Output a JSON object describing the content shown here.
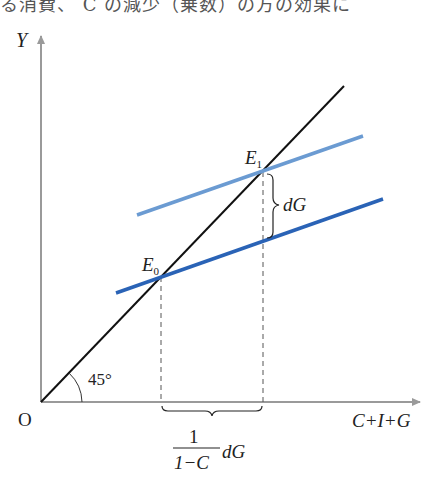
{
  "header": {
    "cut_off_text": "る消費、 C の減少（乗数）の方の効果に"
  },
  "diagram": {
    "axes": {
      "y_label": "Y",
      "x_label": "C+I+G",
      "origin_label": "O"
    },
    "angle_label": "45°",
    "points": {
      "e0": {
        "label": "E",
        "subscript": "0"
      },
      "e1": {
        "label": "E",
        "subscript": "1"
      }
    },
    "shift_label": "dG",
    "multiplier_label": {
      "numerator": "1",
      "denominator": "1−C",
      "suffix": "dG"
    },
    "colors": {
      "axis": "#9a9a9a",
      "line_45": "#111111",
      "initial_line": "#2a63b6",
      "shifted_line": "#6b9bd2",
      "dashed": "#555555"
    },
    "lines": [
      {
        "name": "45-degree-line",
        "from": [
          41,
          402
        ],
        "to": [
          344,
          86
        ]
      },
      {
        "name": "aggregate-expenditure-initial",
        "from": [
          116,
          293
        ],
        "to": [
          383,
          199
        ]
      },
      {
        "name": "aggregate-expenditure-shifted",
        "from": [
          137,
          215
        ],
        "to": [
          363,
          136
        ]
      }
    ]
  }
}
